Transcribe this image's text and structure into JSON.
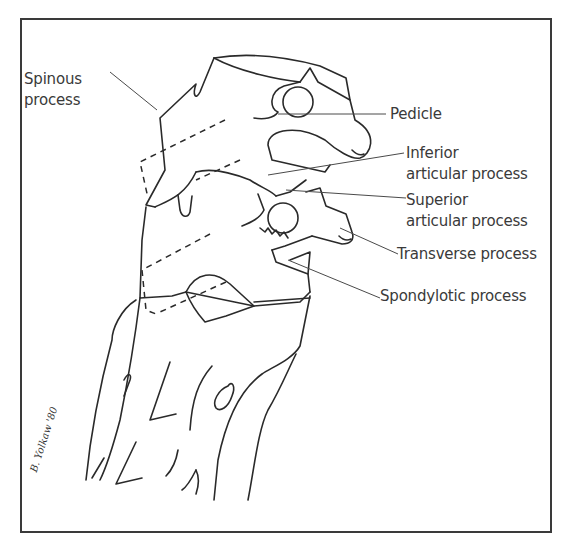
{
  "figure": {
    "labels": {
      "spinous_process": [
        "Spinous",
        "process"
      ],
      "pedicle": "Pedicle",
      "inferior_articular_process": [
        "Inferior",
        "articular process"
      ],
      "superior_articular_process": [
        "Superior",
        "articular process"
      ],
      "transverse_process": "Transverse process",
      "spondylotic_process": "Spondylotic process"
    },
    "signature": "B. Yolkaw '80",
    "colors": {
      "line": "#2a2a2a",
      "text": "#3a3a3a",
      "background": "#ffffff"
    }
  }
}
